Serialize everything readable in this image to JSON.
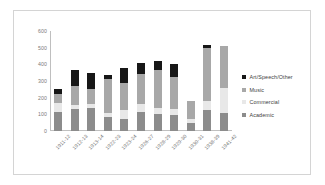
{
  "chart_data": {
    "type": "bar",
    "stacked": true,
    "title": "",
    "xlabel": "",
    "ylabel": "",
    "ylim": [
      0,
      600
    ],
    "yticks": [
      600,
      500,
      400,
      300,
      200,
      100,
      0
    ],
    "grid": false,
    "legend_position": "right",
    "categories": [
      "1911-12",
      "1912-13",
      "1913-14",
      "1922-23",
      "1923-24",
      "1926-27",
      "1928-29",
      "1929-30",
      "1930-31",
      "1938-39",
      "1941-42"
    ],
    "series": [
      {
        "name": "Academic",
        "color": "#8c8c8c",
        "values": [
          115,
          130,
          140,
          85,
          70,
          115,
          105,
          95,
          50,
          125,
          110
        ]
      },
      {
        "name": "Commercial",
        "color": "#e8e8e8",
        "values": [
          55,
          25,
          20,
          25,
          55,
          50,
          35,
          35,
          20,
          55,
          150
        ]
      },
      {
        "name": "Music",
        "color": "#a8a8a8",
        "values": [
          55,
          115,
          90,
          205,
          165,
          175,
          225,
          195,
          110,
          320,
          250
        ]
      },
      {
        "name": "Art/Speech/Other",
        "color": "#171717",
        "values": [
          25,
          95,
          100,
          20,
          90,
          70,
          55,
          75,
          0,
          15,
          0
        ]
      }
    ],
    "totals": [
      250,
      365,
      350,
      335,
      380,
      410,
      420,
      400,
      180,
      515,
      510
    ]
  },
  "legend": {
    "items": [
      {
        "label": "Art/Speech/Other",
        "color": "#171717",
        "swatch": "legend-swatch-art"
      },
      {
        "label": "Music",
        "color": "#a8a8a8",
        "swatch": "legend-swatch-music"
      },
      {
        "label": "Commercial",
        "color": "#e8e8e8",
        "swatch": "legend-swatch-commercial"
      },
      {
        "label": "Academic",
        "color": "#8c8c8c",
        "swatch": "legend-swatch-academic"
      }
    ]
  },
  "colors": {
    "frame_border": "#d4d4d4",
    "axis": "#bfbfbf",
    "tick_text": "#7a7a7a",
    "label_text": "#6e6e6e",
    "legend_text": "#3d3d3d",
    "background": "#ffffff"
  }
}
